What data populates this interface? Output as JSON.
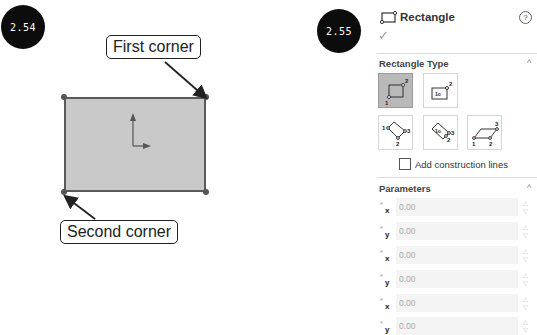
{
  "figure_left": {
    "badge": "2.54",
    "callout_first": "First corner",
    "callout_second": "Second corner"
  },
  "figure_right": {
    "badge": "2.55"
  },
  "property_manager": {
    "title": "Rectangle",
    "help_icon": "?",
    "ok_icon": "✓",
    "rectangle_type": {
      "title": "Rectangle Type",
      "options": [
        {
          "name": "corner-rectangle",
          "selected": true
        },
        {
          "name": "center-rectangle",
          "selected": false
        },
        {
          "name": "3-point-corner-rectangle",
          "selected": false
        },
        {
          "name": "3-point-center-rectangle",
          "selected": false
        },
        {
          "name": "parallelogram",
          "selected": false
        }
      ],
      "construction_lines_label": "Add construction lines",
      "construction_lines_checked": false
    },
    "parameters": {
      "title": "Parameters",
      "fields": [
        {
          "axis": "x",
          "value": "0.00"
        },
        {
          "axis": "y",
          "value": "0.00"
        },
        {
          "axis": "x",
          "value": "0.00"
        },
        {
          "axis": "y",
          "value": "0.00"
        },
        {
          "axis": "x",
          "value": "0.00"
        },
        {
          "axis": "y",
          "value": "0.00"
        }
      ]
    }
  }
}
